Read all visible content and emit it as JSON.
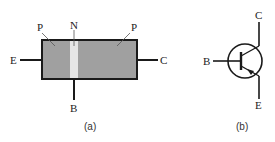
{
  "figure_a": {
    "caption": "(a)",
    "labels": {
      "left_region": "P",
      "middle_region": "N",
      "right_region": "P",
      "emitter": "E",
      "base": "B",
      "collector": "C"
    },
    "colors": {
      "semiconductor": "#a0a0a0",
      "n_layer": "#e6e6e6",
      "outline": "#1a1a1a"
    }
  },
  "figure_b": {
    "caption": "(b)",
    "symbol": "PNP transistor",
    "labels": {
      "base": "B",
      "collector": "C",
      "emitter": "E"
    }
  }
}
